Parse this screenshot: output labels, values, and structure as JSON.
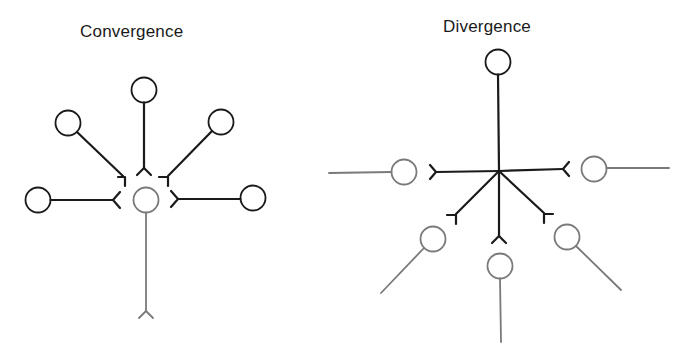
{
  "panels": [
    {
      "title": "Convergence",
      "description": "Five presynaptic neurons (black) converge onto one postsynaptic neuron (gray)",
      "presynaptic_count": 5,
      "postsynaptic_count": 1
    },
    {
      "title": "Divergence",
      "description": "One presynaptic neuron (black) diverges onto five postsynaptic neurons (gray)",
      "presynaptic_count": 1,
      "postsynaptic_count": 5
    }
  ],
  "colors": {
    "presynaptic": "#1a1a1a",
    "postsynaptic": "#7a7a7a",
    "background": "#ffffff"
  }
}
